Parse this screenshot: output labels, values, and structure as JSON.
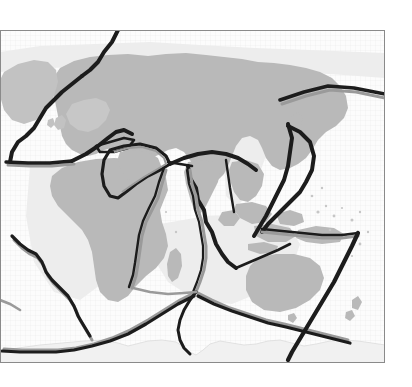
{
  "figure": {
    "kind": "map",
    "width": 412,
    "height": 387,
    "projection": "equirectangular",
    "background_color": "#ffffff"
  },
  "frame": {
    "name": "map-frame",
    "x": 0,
    "y": 30,
    "width": 385,
    "height": 333,
    "stroke_color": "#8a8a8a",
    "stroke_width": 1,
    "fill_color": "#fdfdfd"
  },
  "legend_colors": {
    "ocean": "#fbfbfb",
    "ocean_grid": "#e8e8e8",
    "shelf": "#ebebeb",
    "land": "#b9b9b9",
    "land_light": "#cfcfcf",
    "ice_sheet": "#f2f2f2",
    "boundary_dark": "#1c1c1c",
    "boundary_gray": "#9a9a9a",
    "frame": "#8a8a8a"
  },
  "graticule": {
    "name": "ocean-grid",
    "visible": true,
    "spacing_px": 5,
    "color": "#e8e8e8"
  },
  "landmasses": [
    {
      "name": "greenland",
      "label": "Greenland"
    },
    {
      "name": "eurasia",
      "label": "Eurasia"
    },
    {
      "name": "africa",
      "label": "Africa"
    },
    {
      "name": "arabia",
      "label": "Arabian Peninsula"
    },
    {
      "name": "india",
      "label": "Indian Subcontinent"
    },
    {
      "name": "southeast-asia",
      "label": "Southeast Asia"
    },
    {
      "name": "indonesia",
      "label": "Indonesian Archipelago"
    },
    {
      "name": "new-guinea",
      "label": "New Guinea"
    },
    {
      "name": "australia",
      "label": "Australia"
    },
    {
      "name": "madagascar",
      "label": "Madagascar"
    },
    {
      "name": "japan",
      "label": "Japan"
    },
    {
      "name": "antarctica",
      "label": "Antarctica"
    },
    {
      "name": "british-isles",
      "label": "British Isles"
    },
    {
      "name": "new-zealand",
      "label": "New Zealand"
    }
  ],
  "plate_boundaries": [
    {
      "name": "arctic-ridge",
      "style": "dark",
      "label": "Arctic / Gakkel Ridge"
    },
    {
      "name": "mid-atlantic-ridge-north",
      "style": "dark",
      "label": "Mid-Atlantic Ridge (North)"
    },
    {
      "name": "azores-gibraltar",
      "style": "dark",
      "label": "Azores-Gibraltar Transform"
    },
    {
      "name": "alpide-belt",
      "style": "dark",
      "label": "Alpide Belt"
    },
    {
      "name": "anatolian-plate",
      "style": "dark",
      "label": "Anatolian Plate"
    },
    {
      "name": "arabian-plate",
      "style": "dark",
      "label": "Arabian Plate"
    },
    {
      "name": "himalayan-front",
      "style": "dark",
      "label": "Himalayan Front"
    },
    {
      "name": "sunda-trench",
      "style": "dark",
      "label": "Sunda Trench"
    },
    {
      "name": "philippine-plate",
      "style": "dark",
      "label": "Philippine Sea Plate"
    },
    {
      "name": "izu-bonin-arc",
      "style": "dark",
      "label": "Izu-Bonin-Mariana Arc"
    },
    {
      "name": "kermadec-tonga-trench",
      "style": "dark",
      "label": "Tonga-Kermadec Trench"
    },
    {
      "name": "east-african-rift",
      "style": "gray",
      "label": "East African Rift"
    },
    {
      "name": "carlsberg-ridge",
      "style": "gray",
      "label": "Carlsberg Ridge"
    },
    {
      "name": "central-indian-ridge",
      "style": "gray",
      "label": "Central Indian Ridge"
    },
    {
      "name": "southwest-indian-ridge",
      "style": "gray",
      "label": "Southwest Indian Ridge"
    },
    {
      "name": "southeast-indian-ridge",
      "style": "gray",
      "label": "Southeast Indian Ridge"
    },
    {
      "name": "mid-atlantic-ridge-south",
      "style": "gray",
      "label": "Mid-Atlantic Ridge (South)"
    },
    {
      "name": "pacific-antarctic-ridge",
      "style": "gray",
      "label": "Pacific-Antarctic Ridge"
    }
  ]
}
